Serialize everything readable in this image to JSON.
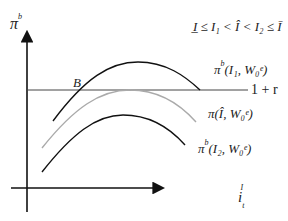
{
  "diagram": {
    "y_axis_label": "π",
    "y_axis_label_sup": "b",
    "x_axis_label": "i",
    "x_axis_label_sub": "t",
    "x_axis_label_sup": "I",
    "condition": "I̲ ≤ I₁ < Î < I₂ ≤ Ī",
    "point_label": "B",
    "hline_label": "1 + r",
    "curves": [
      {
        "name": "curve-I1",
        "label": "π",
        "sup": "b",
        "args": "(I₁, W₀ᵉ)",
        "color": "#111111"
      },
      {
        "name": "curve-Ihat",
        "label": "π",
        "sup": "",
        "args": "(Î, W₀ᵉ)",
        "color": "#aaaaaa"
      },
      {
        "name": "curve-I2",
        "label": "π",
        "sup": "b",
        "args": "(I₂, W₀ᵉ)",
        "color": "#111111"
      }
    ],
    "colors": {
      "axis": "#111111",
      "hline": "#444444",
      "gray_curve": "#aaaaaa"
    }
  }
}
